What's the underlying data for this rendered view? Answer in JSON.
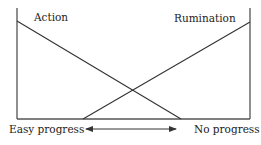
{
  "diagram": {
    "labels": {
      "top_left": "Action",
      "top_right": "Rumination",
      "bottom_left": "Easy progress",
      "bottom_right": "No progress"
    },
    "lines": [
      {
        "name": "Action",
        "from": [
          17,
          21
        ],
        "to": [
          181,
          119
        ]
      },
      {
        "name": "Rumination",
        "from": [
          83,
          119
        ],
        "to": [
          250,
          22
        ]
      }
    ],
    "axis": {
      "left_x": 17,
      "right_x": 250,
      "top_y": 8,
      "baseline_y": 119
    },
    "arrow": {
      "y": 129,
      "x1": 85,
      "x2": 176,
      "type": "double-headed"
    },
    "colors": {
      "line": "#333333",
      "text": "#222222",
      "background": "#ffffff"
    }
  }
}
